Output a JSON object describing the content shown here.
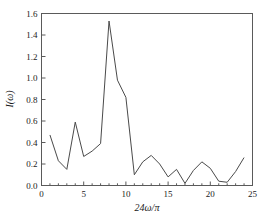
{
  "chart_data": {
    "type": "line",
    "title": "",
    "xlabel": "24ω/π",
    "ylabel": "I(ω)",
    "xlim": [
      0,
      25
    ],
    "ylim": [
      0.0,
      1.6
    ],
    "grid": false,
    "legend": "none",
    "xticks": [
      0,
      5,
      10,
      15,
      20,
      25
    ],
    "xtick_labels": [
      "0",
      "5",
      "10",
      "15",
      "20",
      "25"
    ],
    "xminor_ticks": [
      1,
      2,
      3,
      4,
      6,
      7,
      8,
      9,
      11,
      12,
      13,
      14,
      16,
      17,
      18,
      19,
      21,
      22,
      23,
      24
    ],
    "yticks": [
      0.0,
      0.2,
      0.4,
      0.6,
      0.8,
      1.0,
      1.2,
      1.4,
      1.6
    ],
    "ytick_labels": [
      "0.0",
      "0.2",
      "0.4",
      "0.6",
      "0.8",
      "1.0",
      "1.2",
      "1.4",
      "1.6"
    ],
    "line_color": "#4a4a4a",
    "frame_color": "#5a5a5a",
    "x": [
      1,
      2,
      3,
      4,
      5,
      6,
      7,
      8,
      9,
      10,
      11,
      12,
      13,
      14,
      15,
      16,
      17,
      18,
      19,
      20,
      21,
      22,
      23,
      24
    ],
    "values": [
      0.47,
      0.23,
      0.15,
      0.59,
      0.27,
      0.32,
      0.39,
      1.53,
      0.98,
      0.82,
      0.1,
      0.22,
      0.28,
      0.2,
      0.08,
      0.15,
      0.02,
      0.14,
      0.22,
      0.16,
      0.04,
      0.03,
      0.13,
      0.26
    ],
    "series": [
      {
        "name": "I(ω)",
        "values": [
          0.47,
          0.23,
          0.15,
          0.59,
          0.27,
          0.32,
          0.39,
          1.53,
          0.98,
          0.82,
          0.1,
          0.22,
          0.28,
          0.2,
          0.08,
          0.15,
          0.02,
          0.14,
          0.22,
          0.16,
          0.04,
          0.03,
          0.13,
          0.26
        ]
      }
    ],
    "peak": {
      "x": 8,
      "y": 1.53
    }
  }
}
